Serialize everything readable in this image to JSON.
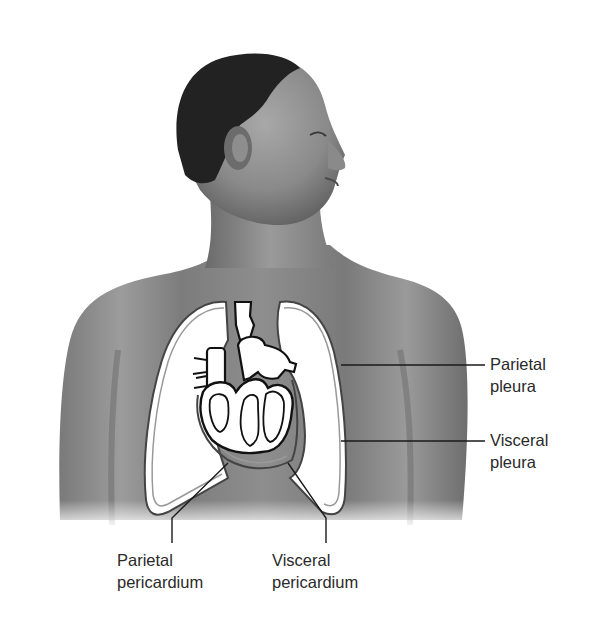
{
  "figure": {
    "colors": {
      "background": "#ffffff",
      "skin_light": "#9a9a9a",
      "skin_dark": "#5a5a5a",
      "hair": "#1e1e1e",
      "organ_fill": "#ffffff",
      "membrane_line": "#3a3a3a",
      "leader_line": "#1a1a1a",
      "label_text": "#2a2a2a"
    }
  },
  "labels": {
    "parietal_pleura": {
      "line1": "Parietal",
      "line2": "pleura"
    },
    "visceral_pleura": {
      "line1": "Visceral",
      "line2": "pleura"
    },
    "parietal_pericardium": {
      "line1": "Parietal",
      "line2": "pericardium"
    },
    "visceral_pericardium": {
      "line1": "Visceral",
      "line2": "pericardium"
    }
  }
}
